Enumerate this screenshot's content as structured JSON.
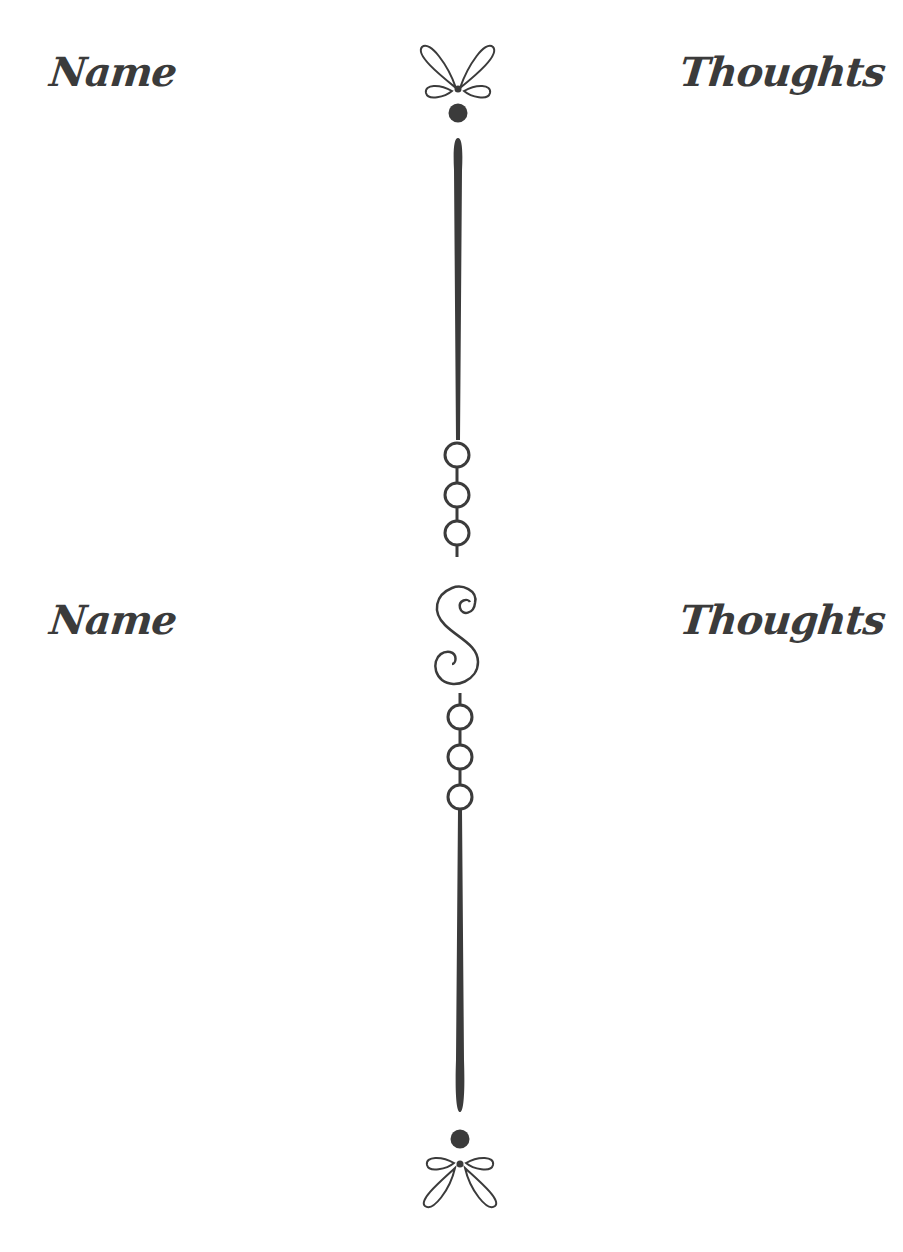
{
  "sections": [
    {
      "left_heading": "Name",
      "right_heading": "Thoughts"
    },
    {
      "left_heading": "Name",
      "right_heading": "Thoughts"
    }
  ],
  "ornaments": {
    "top": "bow-flourish-icon",
    "upper_divider": "vertical-line-with-three-rings",
    "middle": "s-swirl-icon",
    "lower_divider": "three-rings-with-vertical-line",
    "bottom": "bow-flourish-icon"
  },
  "colors": {
    "ink": "#3b3b3b",
    "background": "#ffffff"
  }
}
